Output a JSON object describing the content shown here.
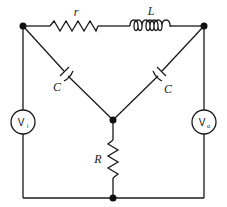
{
  "diagram": {
    "type": "circuit-schematic",
    "components": {
      "series_resistor": {
        "label": "r"
      },
      "inductor": {
        "label": "L"
      },
      "left_capacitor": {
        "label": "C"
      },
      "right_capacitor": {
        "label": "C"
      },
      "shunt_resistor": {
        "label": "R"
      },
      "input_source": {
        "label": "V",
        "subscript": "i"
      },
      "output_meter": {
        "label": "V",
        "subscript": "o"
      }
    },
    "colors": {
      "line": "#1a1a1a",
      "background": "#ffffff"
    }
  }
}
